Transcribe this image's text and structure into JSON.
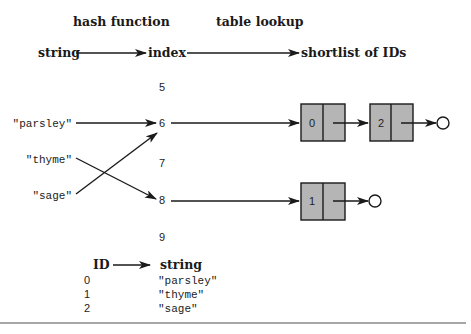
{
  "headers": {
    "hash_function": "hash function",
    "table_lookup": "table lookup"
  },
  "pipeline": {
    "string": "string",
    "index": "index",
    "shortlist": "shortlist of IDs"
  },
  "inputs": [
    {
      "label": "\"parsley\"",
      "maps_to_index": 6
    },
    {
      "label": "\"thyme\"",
      "maps_to_index": 8
    },
    {
      "label": "\"sage\"",
      "maps_to_index": 6
    }
  ],
  "indices": [
    "5",
    "6",
    "7",
    "8",
    "9"
  ],
  "buckets": [
    {
      "index": "6",
      "chain": [
        "0",
        "2"
      ]
    },
    {
      "index": "8",
      "chain": [
        "1"
      ]
    }
  ],
  "id_table": {
    "header_id": "ID",
    "header_string": "string",
    "rows": [
      {
        "id": "0",
        "string": "\"parsley\""
      },
      {
        "id": "1",
        "string": "\"thyme\""
      },
      {
        "id": "2",
        "string": "\"sage\""
      }
    ]
  },
  "colors": {
    "node_fill": "#b5b5b5",
    "stroke": "#1a1a1a",
    "rule": "#888888"
  }
}
